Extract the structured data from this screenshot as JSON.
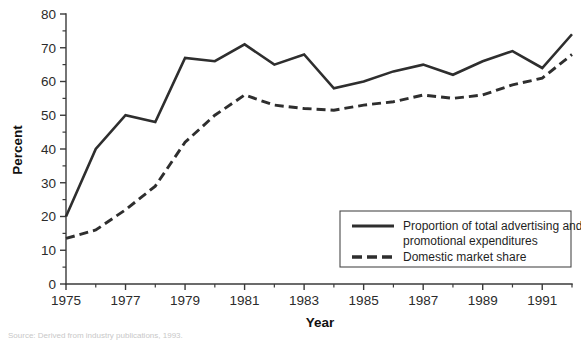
{
  "chart_data": {
    "type": "line",
    "title": "",
    "xlabel": "Year",
    "ylabel": "Percent",
    "xlim": [
      1975,
      1992
    ],
    "ylim": [
      0,
      80
    ],
    "grid": false,
    "legend_position": "inside-lower-right",
    "x": [
      1975,
      1976,
      1977,
      1978,
      1979,
      1980,
      1981,
      1982,
      1983,
      1984,
      1985,
      1986,
      1987,
      1988,
      1989,
      1990,
      1991,
      1992
    ],
    "xtick_labels": [
      "1975",
      "1977",
      "1979",
      "1981",
      "1983",
      "1985",
      "1987",
      "1989",
      "1991"
    ],
    "xtick_values": [
      1975,
      1977,
      1979,
      1981,
      1983,
      1985,
      1987,
      1989,
      1991
    ],
    "xtick_minor_values": [
      1976,
      1978,
      1980,
      1982,
      1984,
      1986,
      1988,
      1990,
      1992
    ],
    "ytick_labels": [
      "0",
      "10",
      "20",
      "30",
      "40",
      "50",
      "60",
      "70",
      "80"
    ],
    "ytick_values": [
      0,
      10,
      20,
      30,
      40,
      50,
      60,
      70,
      80
    ],
    "ytick_minor_values": [
      5,
      15,
      25,
      35,
      45,
      55,
      65,
      75
    ],
    "series": [
      {
        "name": "Proportion of total advertising and promotional expenditures",
        "style": "solid",
        "color": "#2e2e2e",
        "values": [
          20,
          40,
          50,
          48,
          67,
          66,
          71,
          65,
          68,
          58,
          60,
          63,
          65,
          62,
          66,
          69,
          64,
          74
        ]
      },
      {
        "name": "Domestic market share",
        "style": "dashed",
        "color": "#2e2e2e",
        "values": [
          13.5,
          16,
          22,
          29,
          42,
          50,
          56,
          53,
          52,
          51.5,
          53,
          54,
          56,
          55,
          56,
          59,
          61,
          68
        ]
      }
    ]
  },
  "axes": {
    "y_title": "Percent",
    "x_title": "Year"
  },
  "legend": {
    "entries": [
      {
        "line1": "Proportion of total advertising and",
        "line2": "promotional expenditures",
        "style": "solid"
      },
      {
        "line1": "Domestic market share",
        "line2": "",
        "style": "dashed"
      }
    ]
  },
  "footer": {
    "caption": "Source: Derived from industry publications, 1993."
  },
  "colors": {
    "line": "#2e2e2e",
    "axis": "#3a3a3a",
    "text": "#1f1f1f",
    "background": "#ffffff"
  }
}
